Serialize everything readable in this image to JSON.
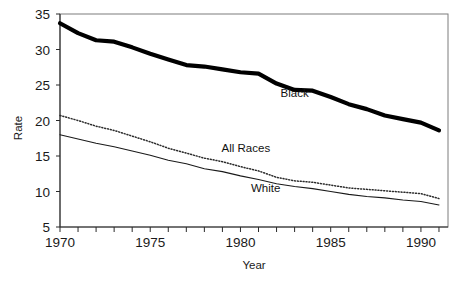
{
  "chart_data": {
    "type": "line",
    "title": "",
    "xlabel": "Year",
    "ylabel": "Rate",
    "xlim": [
      1970,
      1991.5
    ],
    "ylim": [
      5,
      35
    ],
    "yticks": [
      5,
      10,
      15,
      20,
      25,
      30,
      35
    ],
    "ytick_labels": [
      "5",
      "10",
      "15",
      "20",
      "25",
      "30",
      "35"
    ],
    "xticks": [
      1970,
      1971,
      1972,
      1973,
      1974,
      1975,
      1976,
      1977,
      1978,
      1979,
      1980,
      1981,
      1982,
      1983,
      1984,
      1985,
      1986,
      1987,
      1988,
      1989,
      1990,
      1991
    ],
    "xtick_labels": [
      "1970",
      "1975",
      "1980",
      "1985",
      "1990"
    ],
    "xtick_label_values": [
      1970,
      1975,
      1980,
      1985,
      1990
    ],
    "grid": false,
    "legend_position": "inline-annotations",
    "x": [
      1970,
      1971,
      1972,
      1973,
      1974,
      1975,
      1976,
      1977,
      1978,
      1979,
      1980,
      1981,
      1982,
      1983,
      1984,
      1985,
      1986,
      1987,
      1988,
      1989,
      1990,
      1991
    ],
    "series": [
      {
        "name": "Black",
        "style": "thick-solid",
        "color": "#000000",
        "values": [
          33.7,
          32.3,
          31.3,
          31.1,
          30.3,
          29.4,
          28.6,
          27.8,
          27.6,
          27.2,
          26.8,
          26.6,
          25.2,
          24.3,
          24.2,
          23.3,
          22.3,
          21.6,
          20.7,
          20.2,
          19.7,
          18.6
        ]
      },
      {
        "name": "All Races",
        "style": "dotted",
        "color": "#2b2b2b",
        "values": [
          20.7,
          20.0,
          19.2,
          18.6,
          17.8,
          17.0,
          16.1,
          15.4,
          14.7,
          14.2,
          13.5,
          12.9,
          12.0,
          11.5,
          11.3,
          10.9,
          10.5,
          10.3,
          10.1,
          9.9,
          9.7,
          9.0
        ]
      },
      {
        "name": "White",
        "style": "thin-solid",
        "color": "#1a1a1a",
        "values": [
          18.0,
          17.4,
          16.8,
          16.3,
          15.7,
          15.1,
          14.4,
          13.9,
          13.2,
          12.8,
          12.2,
          11.7,
          11.1,
          10.7,
          10.4,
          10.0,
          9.6,
          9.3,
          9.1,
          8.8,
          8.6,
          8.1
        ]
      }
    ],
    "annotations": [
      {
        "text": "Black",
        "x": 1983.0,
        "y": 23.3
      },
      {
        "text": "All Races",
        "x": 1980.3,
        "y": 15.6
      },
      {
        "text": "White",
        "x": 1981.4,
        "y": 10.0
      }
    ]
  },
  "figure": {
    "caption": ""
  }
}
